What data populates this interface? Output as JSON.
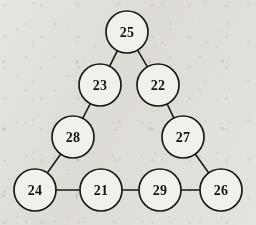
{
  "figure": {
    "kind": "triangle-magic-graph",
    "background_color": "#eeedea",
    "ink_color": "#1c1a18",
    "node_fill_color": "#f1f0ed",
    "node_radius": 21,
    "nodes": [
      {
        "id": "n25",
        "label": "25",
        "cx": 127,
        "cy": 32,
        "position": "apex"
      },
      {
        "id": "n23",
        "label": "23",
        "cx": 100,
        "cy": 85,
        "position": "left-upper"
      },
      {
        "id": "n22",
        "label": "22",
        "cx": 158,
        "cy": 85,
        "position": "right-upper"
      },
      {
        "id": "n28",
        "label": "28",
        "cx": 73,
        "cy": 137,
        "position": "left-lower"
      },
      {
        "id": "n27",
        "label": "27",
        "cx": 183,
        "cy": 137,
        "position": "right-lower"
      },
      {
        "id": "n24",
        "label": "24",
        "cx": 35,
        "cy": 190,
        "position": "bottom-left-corner"
      },
      {
        "id": "n21",
        "label": "21",
        "cx": 101,
        "cy": 190,
        "position": "bottom-inner-left"
      },
      {
        "id": "n29",
        "label": "29",
        "cx": 160,
        "cy": 190,
        "position": "bottom-inner-right"
      },
      {
        "id": "n26",
        "label": "26",
        "cx": 221,
        "cy": 190,
        "position": "bottom-right-corner"
      }
    ],
    "edges": [
      {
        "id": "e1",
        "from": "n25",
        "to": "n23",
        "side": "left"
      },
      {
        "id": "e2",
        "from": "n25",
        "to": "n22",
        "side": "right"
      },
      {
        "id": "e3",
        "from": "n23",
        "to": "n28",
        "side": "left"
      },
      {
        "id": "e4",
        "from": "n22",
        "to": "n27",
        "side": "right"
      },
      {
        "id": "e5",
        "from": "n28",
        "to": "n24",
        "side": "left"
      },
      {
        "id": "e6",
        "from": "n27",
        "to": "n26",
        "side": "right"
      },
      {
        "id": "e7",
        "from": "n24",
        "to": "n21",
        "side": "bottom"
      },
      {
        "id": "e8",
        "from": "n21",
        "to": "n29",
        "side": "bottom"
      },
      {
        "id": "e9",
        "from": "n29",
        "to": "n26",
        "side": "bottom"
      }
    ]
  }
}
